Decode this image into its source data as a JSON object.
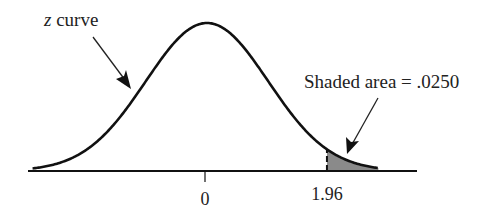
{
  "chart_data": {
    "type": "area",
    "title": "",
    "xlabel": "",
    "ylabel": "",
    "curve_label_var": "z",
    "curve_label_rest": " curve",
    "x_ticks": [
      {
        "value": 0,
        "label": "0"
      },
      {
        "value": 1.96,
        "label": "1.96"
      }
    ],
    "shaded_region": {
      "from": 1.96,
      "to": "inf",
      "area": 0.025
    },
    "annotation": "Shaded area = .0250",
    "xlim": [
      -3.8,
      4.5
    ],
    "grid": false,
    "legend": "none",
    "colors": {
      "curve": "#111111",
      "shade": "#8a8a8a",
      "axis": "#111111"
    }
  }
}
